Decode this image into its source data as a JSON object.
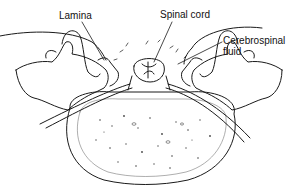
{
  "diagram": {
    "labels": {
      "lamina": "Lamina",
      "spinal_cord": "Spinal cord",
      "csf_line1": "Cerebrospinal",
      "csf_line2": "fluid"
    },
    "colors": {
      "line": "#1a1a1a",
      "background": "#ffffff"
    }
  }
}
